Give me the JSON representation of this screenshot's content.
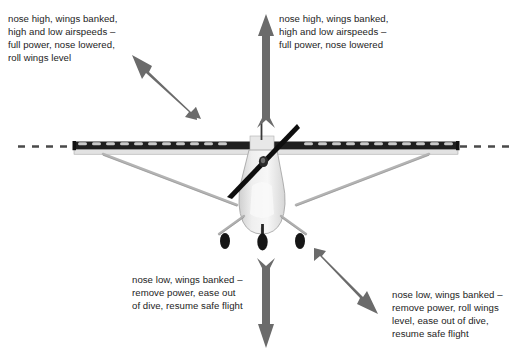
{
  "figure": {
    "background_color": "#ffffff",
    "arrow_color": "#6b6b6b",
    "horizon_color": "#4a4a4a",
    "text_color": "#1c1c1c"
  },
  "callouts": {
    "top_left": {
      "name": "nose-high-wings-banked-roll-level",
      "lines": [
        "nose high, wings banked,",
        "high and low airspeeds –",
        "full power, nose lowered,",
        "roll wings level"
      ],
      "text": "nose high, wings banked,\nhigh and low airspeeds –\nfull power, nose lowered,\nroll wings level"
    },
    "top_right": {
      "name": "nose-high-wings-banked",
      "lines": [
        "nose high, wings banked,",
        "high and low airspeeds –",
        "full power, nose lowered"
      ],
      "text": "nose high, wings banked,\nhigh and low airspeeds –\nfull power, nose lowered"
    },
    "bottom_left": {
      "name": "nose-low-wings-banked-ease-out",
      "lines": [
        "nose low, wings banked –",
        "remove power, ease out",
        "of dive, resume safe flight"
      ],
      "text": "nose low, wings banked –\nremove power, ease out\nof dive, resume safe flight"
    },
    "bottom_right": {
      "name": "nose-low-wings-banked-roll-level",
      "lines": [
        "nose low, wings banked –",
        "remove power, roll wings",
        "level, ease out of dive,",
        "resume safe flight"
      ],
      "text": "nose low, wings banked –\nremove power, roll wings\nlevel, ease out of dive,\nresume safe flight"
    }
  },
  "arrows": {
    "upper_left": {
      "name": "arrow-up-left",
      "direction": "up-left",
      "color": "#6b6b6b"
    },
    "upper_center": {
      "name": "arrow-up",
      "direction": "up",
      "color": "#6b6b6b"
    },
    "lower_center": {
      "name": "arrow-down",
      "direction": "down",
      "color": "#6b6b6b"
    },
    "lower_right": {
      "name": "arrow-down-right",
      "direction": "down-right",
      "color": "#6b6b6b"
    }
  },
  "aircraft": {
    "name": "aircraft-front-view",
    "type": "high-wing single-engine airplane, front view",
    "parts": [
      "wings",
      "propeller",
      "fuselage",
      "wing-struts",
      "nose-wheel",
      "main-wheels",
      "antenna"
    ]
  },
  "horizon": {
    "name": "horizon-reference-line",
    "style": "dashed",
    "color": "#4a4a4a"
  }
}
